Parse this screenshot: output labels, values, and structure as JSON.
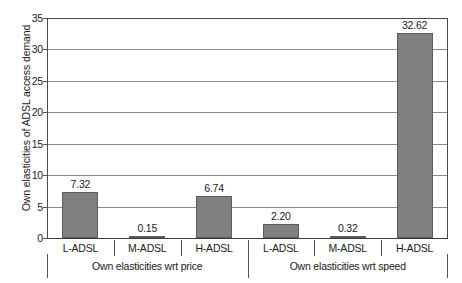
{
  "chart_data": {
    "type": "bar",
    "title": "",
    "subtitle": "",
    "xlabel": "",
    "ylabel": "Own elasticities of ADSL access demand",
    "ylim": [
      0,
      35
    ],
    "ytick_values": [
      0,
      5,
      10,
      15,
      20,
      25,
      30,
      35
    ],
    "ytick_labels": [
      "0",
      "5",
      "10",
      "15",
      "20",
      "25",
      "30",
      "35"
    ],
    "grid": true,
    "legend": false,
    "categories": [
      "L-ADSL",
      "M-ADSL",
      "H-ADSL",
      "L-ADSL",
      "M-ADSL",
      "H-ADSL"
    ],
    "values": [
      7.32,
      0.15,
      6.74,
      2.2,
      0.32,
      32.62
    ],
    "value_labels": [
      "7.32",
      "0.15",
      "6.74",
      "2.20",
      "0.32",
      "32.62"
    ],
    "groups": [
      {
        "label": "Own elasticities wrt price",
        "categories": [
          "L-ADSL",
          "M-ADSL",
          "H-ADSL"
        ],
        "values": [
          7.32,
          0.15,
          6.74
        ]
      },
      {
        "label": "Own elasticities wrt speed",
        "categories": [
          "L-ADSL",
          "M-ADSL",
          "H-ADSL"
        ],
        "values": [
          2.2,
          0.32,
          32.62
        ]
      }
    ],
    "colors": {
      "bar_fill": "#808080",
      "bar_border": "#5c5c5c",
      "gridline": "#8c8c8c",
      "axis": "#4a4a4a",
      "text": "#1a1a1a",
      "background": "#ffffff"
    }
  }
}
